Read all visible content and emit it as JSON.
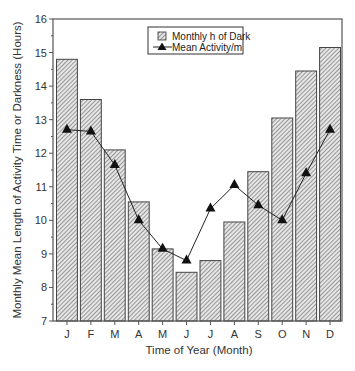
{
  "chart_data": {
    "type": "bar+line",
    "title": "",
    "xlabel": "Time of Year (Month)",
    "ylabel": "Monthly Mean Length of Activity Time or Darkness (Hours)",
    "categories": [
      "J",
      "F",
      "M",
      "A",
      "M",
      "J",
      "J",
      "A",
      "S",
      "O",
      "N",
      "D"
    ],
    "ylim": [
      7,
      16
    ],
    "yticks": [
      7,
      8,
      9,
      10,
      11,
      12,
      13,
      14,
      15,
      16
    ],
    "grid": false,
    "legend_position": "top-center",
    "series": [
      {
        "name": "Monthly h of Dark",
        "type": "bar",
        "style": "hatched",
        "values": [
          14.8,
          13.6,
          12.1,
          10.55,
          9.15,
          8.45,
          8.8,
          9.95,
          11.45,
          13.05,
          14.45,
          15.15
        ]
      },
      {
        "name": "Mean Activity/m",
        "type": "line",
        "marker": "triangle",
        "values": [
          12.7,
          12.65,
          11.65,
          10.0,
          9.15,
          8.8,
          10.35,
          11.05,
          10.45,
          10.0,
          11.4,
          12.7
        ]
      }
    ]
  },
  "legend": {
    "bar_label": "Monthly h of Dark",
    "line_label": "Mean Activity/m"
  },
  "colors": {
    "axis": "#555555",
    "bar_fill": "#e8e8e8",
    "hatch": "#555555",
    "line": "#222222"
  }
}
